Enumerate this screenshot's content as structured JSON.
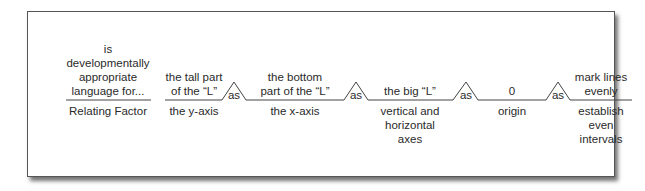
{
  "diagram": {
    "type": "analogy-line-diagram",
    "relating_factor": {
      "above": [
        "is",
        "developmentally",
        "appropriate",
        "language for..."
      ],
      "below": [
        "Relating Factor"
      ]
    },
    "connector_label": "as",
    "items": [
      {
        "above": [
          "the tall part",
          "of the “L”"
        ],
        "below": [
          "the y-axis"
        ]
      },
      {
        "above": [
          "the bottom",
          "part of the “L”"
        ],
        "below": [
          "the x-axis"
        ]
      },
      {
        "above": [
          "the big “L”"
        ],
        "below": [
          "vertical and",
          "horizontal",
          "axes"
        ]
      },
      {
        "above": [
          "0"
        ],
        "below": [
          "origin"
        ]
      },
      {
        "above": [
          "mark lines",
          "evenly"
        ],
        "below": [
          "establish",
          "even",
          "intervals"
        ]
      }
    ],
    "colors": {
      "line": "#444444",
      "text": "#2a2a2a",
      "frame": "#555555"
    }
  }
}
